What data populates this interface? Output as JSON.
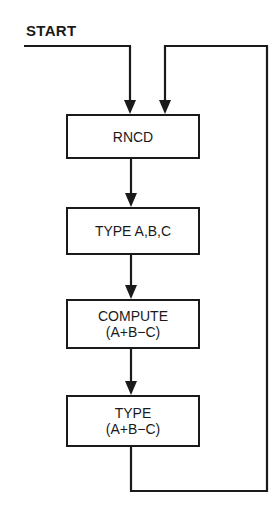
{
  "diagram": {
    "type": "flowchart",
    "start_label": "START",
    "steps": [
      {
        "id": "rncd",
        "lines": [
          "RNCD"
        ]
      },
      {
        "id": "type-abc",
        "lines": [
          "TYPE A,B,C"
        ]
      },
      {
        "id": "compute",
        "lines": [
          "COMPUTE",
          "(A+B−C)"
        ]
      },
      {
        "id": "type-result",
        "lines": [
          "TYPE",
          "(A+B−C)"
        ]
      }
    ],
    "edges": [
      {
        "from": "START",
        "to": "rncd"
      },
      {
        "from": "rncd",
        "to": "type-abc"
      },
      {
        "from": "type-abc",
        "to": "compute"
      },
      {
        "from": "compute",
        "to": "type-result"
      },
      {
        "from": "type-result",
        "to": "rncd",
        "kind": "loop-back"
      }
    ],
    "line_color": "#1a1a1a",
    "background": "#ffffff"
  }
}
